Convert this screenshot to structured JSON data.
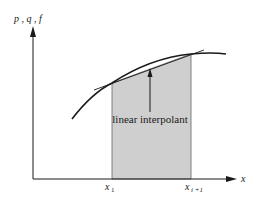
{
  "diagram": {
    "y_axis_label": "p , q , f",
    "x_axis_label": "x",
    "annotation": "linear interpolant",
    "x_ticks": [
      {
        "base": "x",
        "sub": "1"
      },
      {
        "base": "x",
        "sub": "i +1"
      }
    ],
    "colors": {
      "shade": "#cfcfcf",
      "stroke": "#1a1a1a"
    }
  }
}
